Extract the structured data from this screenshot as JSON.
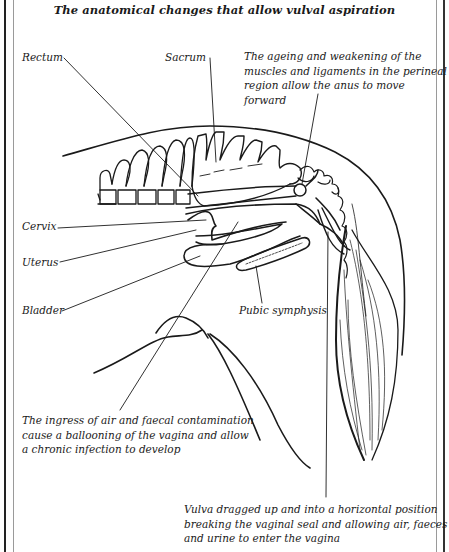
{
  "title": "The anatomical changes that allow vulval aspiration",
  "labels": {
    "rectum": "Rectum",
    "sacrum": "Sacrum",
    "cervix": "Cervix",
    "uterus": "Uterus",
    "bladder": "Bladder",
    "pubic_symphysis": "Pubic symphysis"
  },
  "annotations": {
    "anus": "The ageing and weakening of the\nmuscles and ligaments in the perineal\nregion allow the anus to move forward",
    "vagina": "The ingress of air and faecal contamination\ncause a ballooning of the vagina and allow\na chronic infection to develop",
    "vulva": "Vulva dragged up and into a horizontal position\nbreaking the vaginal seal and allowing air, faeces\nand urine to enter the vagina"
  },
  "colors": {
    "ink": "#1a1a1a",
    "frame": "#222222",
    "frame_inner": "#9a9a9a",
    "background": "#ffffff"
  }
}
